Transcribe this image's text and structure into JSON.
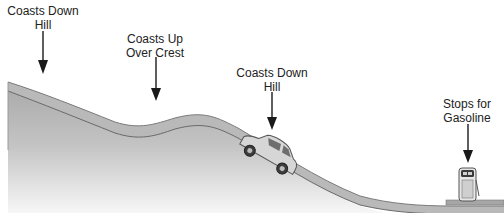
{
  "diagram": {
    "type": "terrain-profile",
    "colors": {
      "ground_top": "#a9a9a9",
      "ground_fade": "#ffffff",
      "road": "#b8b8b8",
      "road_edge": "#6e6e6e",
      "arrow": "#1a1a1a",
      "text": "#222222"
    },
    "labels": [
      {
        "id": "coasts-down-hill-1",
        "line1": "Coasts Down",
        "line2": "Hill",
        "x": 43,
        "y": 4
      },
      {
        "id": "coasts-up-over-crest",
        "line1": "Coasts Up",
        "line2": "Over Crest",
        "x": 155,
        "y": 32
      },
      {
        "id": "coasts-down-hill-2",
        "line1": "Coasts Down",
        "line2": "Hill",
        "x": 272,
        "y": 66
      },
      {
        "id": "stops-for-gasoline",
        "line1": "Stops for",
        "line2": "Gasoline",
        "x": 467,
        "y": 97
      }
    ]
  }
}
